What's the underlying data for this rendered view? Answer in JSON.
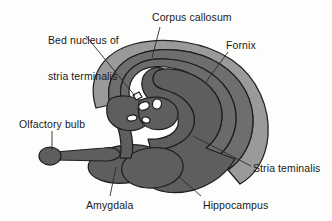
{
  "figure": {
    "background_color": "#fdfdfc",
    "outline_color": "#1f1f1f",
    "leader_line_color": "#2a2a2a",
    "text_color": "#1a1a1a"
  },
  "palette": {
    "corpus_callosum_fill": "#9a9a9a",
    "fornix_fill": "#6e6e6e",
    "stria_terminalis_fill": "#6b6b6b",
    "amygdala_fill": "#5e5e5e",
    "hippocampus_fill": "#5e5e5e",
    "olfactory_bulb_fill": "#5e5e5e",
    "interior_white": "#ffffff",
    "marker_white": "#f4f4f4"
  },
  "labels": [
    {
      "id": "bed-nucleus",
      "text": "Bed nucleus of\nstria terminalis",
      "line1": "Bed nucleus of",
      "line2": "stria terminalis",
      "x": 48,
      "y": 10
    },
    {
      "id": "corpus-callosum",
      "text": "Corpus callosum",
      "x": 152,
      "y": 12
    },
    {
      "id": "fornix",
      "text": "Fornix",
      "x": 226,
      "y": 40
    },
    {
      "id": "olfactory-bulb",
      "text": "Olfactory bulb",
      "x": 19,
      "y": 119
    },
    {
      "id": "stria-teminalis",
      "text": "Stria teminalis",
      "x": 253,
      "y": 163
    },
    {
      "id": "amygdala",
      "text": "Amygdala",
      "x": 86,
      "y": 200
    },
    {
      "id": "hippocampus",
      "text": "Hippocampus",
      "x": 203,
      "y": 200
    }
  ],
  "structures": [
    {
      "id": "corpus-callosum",
      "name": "Corpus callosum"
    },
    {
      "id": "fornix",
      "name": "Fornix"
    },
    {
      "id": "stria-terminalis",
      "name": "Stria terminalis"
    },
    {
      "id": "bed-nucleus",
      "name": "Bed nucleus of stria terminalis"
    },
    {
      "id": "amygdala",
      "name": "Amygdala"
    },
    {
      "id": "hippocampus",
      "name": "Hippocampus"
    },
    {
      "id": "olfactory-bulb",
      "name": "Olfactory bulb"
    }
  ]
}
